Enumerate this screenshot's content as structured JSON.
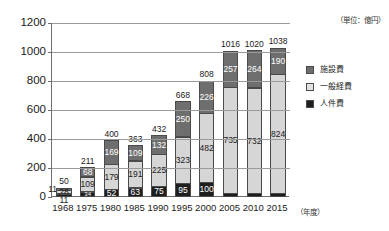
{
  "chart_data": {
    "type": "bar",
    "title": "",
    "subtitle": "",
    "unit_caption": "（単位：億円）",
    "xlabel": "（年度）",
    "ylabel": "",
    "stacked": true,
    "grid": true,
    "legend_position": "right",
    "ylim": [
      0,
      1200
    ],
    "yticks": [
      0,
      200,
      400,
      600,
      800,
      1000,
      1200
    ],
    "ytick_labels": [
      "0",
      "200",
      "400",
      "600",
      "800",
      "1000",
      "1200"
    ],
    "categories": [
      "1968",
      "1975",
      "1980",
      "1985",
      "1990",
      "1995",
      "2000",
      "2005",
      "2010",
      "2015"
    ],
    "series": [
      {
        "name": "人件費",
        "color": "#1e1e1e",
        "values": [
          11,
          34,
          52,
          63,
          75,
          95,
          100,
          24,
          24,
          24
        ]
      },
      {
        "name": "一般経費",
        "color": "#d6d6d6",
        "values": [
          28,
          109,
          179,
          191,
          225,
          323,
          482,
          735,
          732,
          824
        ]
      },
      {
        "name": "施設費",
        "color": "#6e6e6e",
        "values": [
          11,
          68,
          169,
          109,
          132,
          250,
          226,
          257,
          264,
          190
        ]
      }
    ],
    "totals": [
      50,
      211,
      400,
      363,
      432,
      668,
      808,
      1016,
      1020,
      1038
    ],
    "legend": [
      {
        "label": "施設費",
        "color": "#6e6e6e"
      },
      {
        "label": "一般経費",
        "color": "#e2e2e2"
      },
      {
        "label": "人件費",
        "color": "#1e1e1e"
      }
    ],
    "colors": {
      "facility": "#6e6e6e",
      "general": "#d6d6d6",
      "personnel": "#1e1e1e",
      "axis": "#6d6d6d",
      "grid": "#9a9a9a",
      "text": "#1a1a1a",
      "background": "#ffffff"
    },
    "label_placement": {
      "1968": {
        "personnel": "below-axis",
        "general": "inside",
        "facility": "outside-left"
      }
    }
  }
}
